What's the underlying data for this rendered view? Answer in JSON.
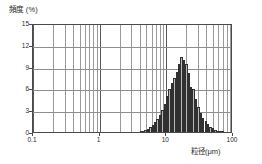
{
  "chart_data": {
    "type": "bar",
    "title": "",
    "subtitle": "",
    "ylabel": "頻度 (%)",
    "xlabel": "粒径(μm)",
    "xscale": "log",
    "yscale": "linear",
    "xlim": [
      0.1,
      100
    ],
    "ylim": [
      0,
      15
    ],
    "grid": true,
    "legend": null,
    "yticks": [
      0,
      3,
      6,
      9,
      12,
      15
    ],
    "ytick_labels": [
      "0",
      "3",
      "6",
      "9",
      "12",
      "15"
    ],
    "xticks": [
      0.1,
      1,
      10,
      100
    ],
    "xtick_labels": [
      "0.1",
      "1",
      "10",
      "100"
    ],
    "bar_color": "#b9b9b9",
    "bar_edge_color": "#303030",
    "grid_color": "#9a9a9a",
    "axis_color": "#4a4a4a",
    "series_name": "particle size distribution",
    "x": [
      3.5,
      3.8,
      4.13,
      4.49,
      4.88,
      5.3,
      5.76,
      6.26,
      6.8,
      7.39,
      8.03,
      8.73,
      9.48,
      10.31,
      11.2,
      12.17,
      13.23,
      14.37,
      15.62,
      16.97,
      18.44,
      20.04,
      21.78,
      23.67,
      25.72,
      27.95,
      30.38,
      33.01,
      35.87,
      38.98,
      42.36,
      46.03,
      50.02,
      54.36,
      59.07,
      64.19,
      69.76,
      75.8
    ],
    "values": [
      0.0,
      0.0,
      0.05,
      0.12,
      0.25,
      0.45,
      0.7,
      1.0,
      1.35,
      1.75,
      2.3,
      3.0,
      3.9,
      4.9,
      5.95,
      6.7,
      7.4,
      8.3,
      9.35,
      10.3,
      9.9,
      9.35,
      8.15,
      6.2,
      5.95,
      4.6,
      3.45,
      2.55,
      1.95,
      1.45,
      1.05,
      0.75,
      0.5,
      0.32,
      0.2,
      0.12,
      0.06,
      0.0
    ]
  },
  "axes": {
    "ytitle": "頻度 (%)",
    "xtitle": "粒径(μm)"
  }
}
